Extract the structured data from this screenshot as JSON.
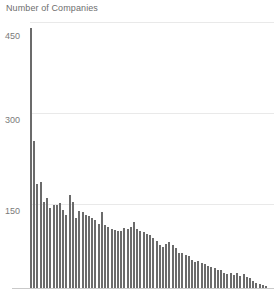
{
  "chart_data": {
    "type": "bar",
    "title": "Number of Companies",
    "subtitle": "",
    "xlabel": "",
    "ylabel": "Number of Companies",
    "ylim": [
      0,
      450
    ],
    "xlim": [
      0,
      74
    ],
    "grid": true,
    "legend": null,
    "y_ticks": [
      150,
      300,
      450
    ],
    "y_tick_labels": [
      "150",
      "300",
      "450"
    ],
    "x_ticks": [],
    "x_tick_labels": [],
    "bar_color": "#6b6b6b",
    "gridline_color": "#e9e9e9",
    "axis_color": "#c9c9c9",
    "text_color": "#6e6e6e",
    "background_color": "#ffffff",
    "categories": [
      "1",
      "2",
      "3",
      "4",
      "5",
      "6",
      "7",
      "8",
      "9",
      "10",
      "11",
      "12",
      "13",
      "14",
      "15",
      "16",
      "17",
      "18",
      "19",
      "20",
      "21",
      "22",
      "23",
      "24",
      "25",
      "26",
      "27",
      "28",
      "29",
      "30",
      "31",
      "32",
      "33",
      "34",
      "35",
      "36",
      "37",
      "38",
      "39",
      "40",
      "41",
      "42",
      "43",
      "44",
      "45",
      "46",
      "47",
      "48",
      "49",
      "50",
      "51",
      "52",
      "53",
      "54",
      "55",
      "56",
      "57",
      "58",
      "59",
      "60",
      "61",
      "62",
      "63",
      "64",
      "65",
      "66",
      "67",
      "68",
      "69",
      "70",
      "71",
      "72",
      "73",
      "74"
    ],
    "values": [
      440,
      249,
      176,
      180,
      146,
      152,
      136,
      141,
      140,
      143,
      132,
      124,
      157,
      145,
      118,
      131,
      128,
      124,
      121,
      118,
      115,
      108,
      129,
      106,
      104,
      100,
      98,
      96,
      97,
      102,
      99,
      103,
      112,
      100,
      96,
      94,
      92,
      90,
      84,
      80,
      73,
      70,
      74,
      78,
      72,
      68,
      60,
      59,
      56,
      54,
      47,
      44,
      46,
      43,
      40,
      38,
      36,
      34,
      31,
      30,
      26,
      24,
      25,
      22,
      26,
      21,
      23,
      19,
      17,
      12,
      9,
      7,
      5,
      4
    ]
  }
}
